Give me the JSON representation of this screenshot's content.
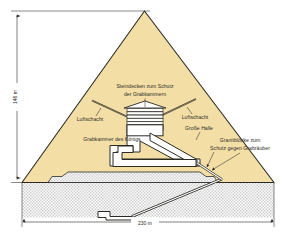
{
  "figure": {
    "colors": {
      "stone_fill": "#f3dfa6",
      "stone_edge": "#2b2b26",
      "bedrock_dot": "#8a8a8a",
      "bedrock_fill": "#ffffff",
      "chamber_fill": "#ffffff",
      "line": "#2b2b26",
      "background": "#ffffff"
    }
  },
  "labels": {
    "roof_slabs": "Steindecken zum Schutz\nder Grabkammern",
    "roof_slabs_line1": "Steindecken zum Schutz",
    "roof_slabs_line2": "der Grabkammern",
    "air_shaft_left": "Luftschacht",
    "air_shaft_right": "Luftschacht",
    "grand_gallery": "Große Halle",
    "kings_chamber": "Grabkammer des Königs",
    "granite_blocks_line1": "Granitblöcke zum",
    "granite_blocks_line2": "Schutz gegen Grabräuber"
  },
  "dimensions": {
    "height": "146 m",
    "base_width": "230 m"
  }
}
